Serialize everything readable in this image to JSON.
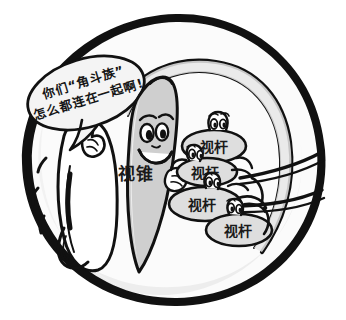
{
  "illustration": {
    "title": "视锥细胞与视杆细胞卡通示意图",
    "width": 346,
    "height": 320,
    "background_color": "#ffffff",
    "ink_color": "#111111",
    "shade_color": "#d8d8d8",
    "outer_frame": {
      "name": "eye-outline-circle",
      "description": "粗黑手绘圆形轮廓"
    },
    "speech_bubble": {
      "name": "speech-bubble",
      "line1": "你们“角斗族”",
      "line2": "怎么都连在一起啊!",
      "rotation_deg": -17
    },
    "characters": [
      {
        "id": "cone-cell",
        "label": "视锥",
        "role": "中央的锥形细胞卡通人物",
        "expression": "微笑"
      },
      {
        "id": "speaker-cell",
        "label": "",
        "role": "左侧说话的细胞卡通人物",
        "expression": "伸出手指"
      },
      {
        "id": "rod-cell-1",
        "label": "视杆",
        "role": "右上方的杆状细胞"
      },
      {
        "id": "rod-cell-2",
        "label": "视杆",
        "role": "右中上方的杆状细胞"
      },
      {
        "id": "rod-cell-3",
        "label": "视杆",
        "role": "右中下方的杆状细胞"
      },
      {
        "id": "rod-cell-4",
        "label": "视杆",
        "role": "右下方的杆状细胞"
      }
    ],
    "nerve_fibers": {
      "name": "nerve-fiber-lines",
      "count": 2,
      "description": "从细胞群延伸到右侧边缘的两条神经纤维"
    }
  }
}
